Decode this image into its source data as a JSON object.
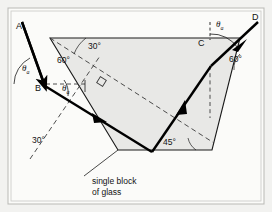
{
  "figure": {
    "caption_line1": "single block",
    "caption_line2": "of glass",
    "points": {
      "A": "A",
      "B": "B",
      "C": "C",
      "D": "D"
    },
    "angles": {
      "top_30": "30°",
      "top_60": "60°",
      "left_30": "30°",
      "bottom_45": "45°",
      "right_60": "60°"
    },
    "theta_incident": "θ",
    "theta_incident_sub": "a",
    "theta_exit": "θ",
    "theta_exit_sub": "a",
    "colors": {
      "page_background": "#f2f2f0",
      "panel_background": "#fbfbf9",
      "glass_fill": "#e8e8e6",
      "outline": "#1a1a1a",
      "ray": "#000000",
      "dashed": "#3a3a3a",
      "text": "#121212",
      "border": "#b9b9b5"
    },
    "geometry": {
      "glass_polygon": "50,38 240,38 212,150 118,150",
      "panel_border": "10,10 262,10 262,202 10,202",
      "ray_in": "22,20 -> 44,84",
      "ray_BtoE": "44,84 -> 152,152",
      "ray_EtoC": "152,152 -> 210,66",
      "ray_out": "210,66 -> 258,22"
    }
  }
}
